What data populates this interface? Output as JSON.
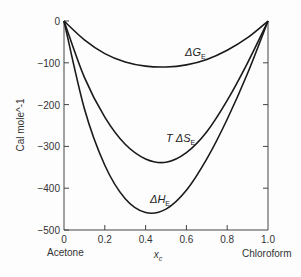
{
  "chart_data": {
    "type": "line",
    "title": "",
    "xlabel": "x_c",
    "ylabel": "Cal mole^-1",
    "xlim": [
      0,
      1.0
    ],
    "ylim": [
      -500,
      0
    ],
    "grid": false,
    "x_ticks": [
      "0",
      "0.2",
      "0.4",
      "0.6",
      "0.8",
      "1.0"
    ],
    "y_ticks": [
      "0",
      "-100",
      "-200",
      "-300",
      "-400",
      "-500"
    ],
    "x_end_labels": {
      "left": "Acetone",
      "right": "Chloroform"
    },
    "series": [
      {
        "name": "ΔG_E",
        "label_main": "ΔG",
        "label_sub": "E",
        "x": [
          0,
          0.1,
          0.2,
          0.3,
          0.4,
          0.5,
          0.6,
          0.7,
          0.8,
          0.9,
          1.0
        ],
        "y": [
          0,
          -45,
          -78,
          -98,
          -108,
          -110,
          -105,
          -92,
          -70,
          -40,
          0
        ]
      },
      {
        "name": "T ΔS_E",
        "label_main": "T ΔS",
        "label_sub": "E",
        "x": [
          0,
          0.1,
          0.2,
          0.3,
          0.4,
          0.5,
          0.6,
          0.7,
          0.8,
          0.9,
          1.0
        ],
        "y": [
          0,
          -135,
          -230,
          -295,
          -330,
          -338,
          -315,
          -265,
          -190,
          -100,
          0
        ]
      },
      {
        "name": "ΔH_E",
        "label_main": "ΔH",
        "label_sub": "E",
        "x": [
          0,
          0.1,
          0.2,
          0.3,
          0.4,
          0.5,
          0.6,
          0.7,
          0.8,
          0.9,
          1.0
        ],
        "y": [
          0,
          -210,
          -345,
          -425,
          -458,
          -450,
          -405,
          -330,
          -235,
          -125,
          0
        ]
      }
    ]
  }
}
